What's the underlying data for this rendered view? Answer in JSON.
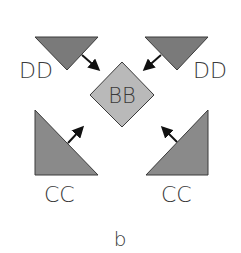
{
  "diagram": {
    "center": {
      "label": "BB",
      "shape": "diamond",
      "fill": "#b9b9b9"
    },
    "top_left": {
      "label": "DD",
      "shape": "inverted-triangle",
      "fill": "#7a7a7a"
    },
    "top_right": {
      "label": "DD",
      "shape": "inverted-triangle",
      "fill": "#7a7a7a"
    },
    "bottom_left": {
      "label": "CC",
      "shape": "right-triangle",
      "fill": "#8a8a8a"
    },
    "bottom_right": {
      "label": "CC",
      "shape": "right-triangle",
      "fill": "#8a8a8a"
    },
    "arrows": [
      {
        "from": "top_left",
        "to": "center"
      },
      {
        "from": "top_right",
        "to": "center"
      },
      {
        "from": "bottom_left",
        "to": "center"
      },
      {
        "from": "bottom_right",
        "to": "center"
      }
    ],
    "panel_label": "b"
  },
  "colors": {
    "stroke": "#3a3a3a",
    "arrow": "#111111",
    "text": "#3a3a3a"
  }
}
